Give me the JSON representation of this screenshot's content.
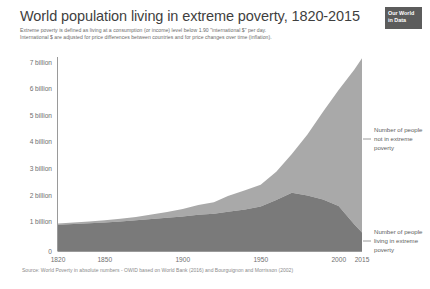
{
  "header": {
    "title": "World population living in extreme poverty, 1820-2015",
    "subtitle_line1": "Extreme poverty is defined as living at a consumption (or income) level below 1.90 \"international $\" per day.",
    "subtitle_line2": "International $ are adjusted for price differences between countries and for price changes over time (inflation)."
  },
  "logo": {
    "line1": "Our World",
    "line2": "in Data"
  },
  "source": {
    "text": "Source: World Poverty in absolute numbers - OWID based on World Bank (2016) and Bourguignon and Morrisson (2002)"
  },
  "legend": {
    "top": {
      "line1": "Number of people",
      "line2": "not in extreme",
      "line3": "poverty"
    },
    "bottom": {
      "line1": "Number of people",
      "line2": "living in extreme",
      "line3": "poverty"
    }
  },
  "colors": {
    "in_poverty": "#7a7a7a",
    "not_in_poverty": "#a9a9a9",
    "axis": "#8c8c8c",
    "text": "#6f6f6f",
    "title": "#3f3f3f",
    "logo_bg": "#5c5c5c"
  },
  "chart_data": {
    "type": "area",
    "stacked": true,
    "title": "World population living in extreme poverty, 1820-2015",
    "subtitle": "Extreme poverty is defined as living at a consumption (or income) level below 1.90 \"international $\" per day. International $ are adjusted for price differences between countries and for price changes over time (inflation).",
    "xlabel": "",
    "ylabel": "",
    "xlim": [
      1820,
      2015
    ],
    "ylim": [
      0,
      7.4
    ],
    "y_unit": "billion people",
    "grid": false,
    "legend_position": "right",
    "x_ticks": [
      1820,
      1850,
      1900,
      1950,
      2000,
      2015
    ],
    "x_tick_labels": [
      "1820",
      "1850",
      "1900",
      "1950",
      "2000",
      "2015"
    ],
    "y_ticks": [
      0,
      1,
      2,
      3,
      4,
      5,
      6,
      7
    ],
    "y_tick_labels": [
      "0",
      "1 billion",
      "2 billion",
      "3 billion",
      "4 billion",
      "5 billion",
      "6 billion",
      "7 billion"
    ],
    "x": [
      1820,
      1830,
      1840,
      1850,
      1860,
      1870,
      1880,
      1890,
      1900,
      1910,
      1920,
      1929,
      1940,
      1950,
      1960,
      1970,
      1980,
      1990,
      2000,
      2010,
      2015
    ],
    "series": [
      {
        "name": "Number of people living in extreme poverty",
        "color": "#7a7a7a",
        "values": [
          1.0,
          1.03,
          1.06,
          1.09,
          1.13,
          1.17,
          1.22,
          1.27,
          1.32,
          1.38,
          1.42,
          1.5,
          1.58,
          1.7,
          1.95,
          2.22,
          2.12,
          1.96,
          1.72,
          1.02,
          0.71
        ]
      },
      {
        "name": "Number of people not in extreme poverty",
        "color": "#a9a9a9",
        "values": [
          0.05,
          0.06,
          0.07,
          0.08,
          0.1,
          0.13,
          0.17,
          0.22,
          0.28,
          0.37,
          0.44,
          0.6,
          0.74,
          0.83,
          1.07,
          1.48,
          2.32,
          3.35,
          4.42,
          5.89,
          6.64
        ]
      }
    ],
    "totals": [
      1.05,
      1.09,
      1.13,
      1.17,
      1.23,
      1.3,
      1.39,
      1.49,
      1.6,
      1.75,
      1.86,
      2.1,
      2.32,
      2.53,
      3.02,
      3.7,
      4.44,
      5.31,
      6.14,
      6.91,
      7.35
    ],
    "annotations": [
      {
        "text": "Number of people not in extreme poverty",
        "target_year": 2015,
        "target_value": 4.3
      },
      {
        "text": "Number of people living in extreme poverty",
        "target_year": 2015,
        "target_value": 0.35
      }
    ]
  }
}
